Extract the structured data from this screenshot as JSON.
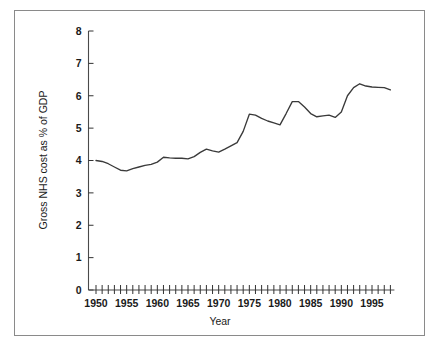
{
  "chart_data": {
    "type": "line",
    "title": "",
    "xlabel": "Year",
    "ylabel": "Gross NHS cost as % of GDP",
    "xlim": [
      1949,
      1998.5
    ],
    "ylim": [
      0,
      8
    ],
    "grid": false,
    "legend": null,
    "y_ticks": [
      "0",
      "1",
      "2",
      "3",
      "4",
      "5",
      "6",
      "7",
      "8"
    ],
    "y_tick_values": [
      0,
      1,
      2,
      3,
      4,
      5,
      6,
      7,
      8
    ],
    "x_ticks": [
      "1950",
      "1955",
      "1960",
      "1965",
      "1970",
      "1975",
      "1980",
      "1985",
      "1990",
      "1995"
    ],
    "x_tick_values": [
      1950,
      1955,
      1960,
      1965,
      1970,
      1975,
      1980,
      1985,
      1990,
      1995
    ],
    "x_minor_tick_interval": 1,
    "line_color": "#3a3a3a",
    "x": [
      1950,
      1951,
      1952,
      1953,
      1954,
      1955,
      1956,
      1957,
      1958,
      1959,
      1960,
      1961,
      1962,
      1963,
      1964,
      1965,
      1966,
      1967,
      1968,
      1969,
      1970,
      1971,
      1972,
      1973,
      1974,
      1975,
      1976,
      1977,
      1978,
      1979,
      1980,
      1981,
      1982,
      1983,
      1984,
      1985,
      1986,
      1987,
      1988,
      1989,
      1990,
      1991,
      1992,
      1993,
      1994,
      1995,
      1996,
      1997,
      1998
    ],
    "values": [
      4.0,
      3.97,
      3.9,
      3.8,
      3.7,
      3.68,
      3.75,
      3.8,
      3.85,
      3.88,
      3.95,
      4.1,
      4.08,
      4.07,
      4.07,
      4.05,
      4.12,
      4.25,
      4.35,
      4.3,
      4.26,
      4.35,
      4.45,
      4.55,
      4.9,
      5.43,
      5.4,
      5.3,
      5.22,
      5.16,
      5.1,
      5.45,
      5.82,
      5.82,
      5.65,
      5.45,
      5.35,
      5.38,
      5.4,
      5.33,
      5.5,
      6.0,
      6.25,
      6.37,
      6.3,
      6.27,
      6.26,
      6.25,
      6.18
    ],
    "series_name": "Gross NHS cost as % of GDP"
  },
  "axis": {
    "x_title": "Year",
    "y_title": "Gross NHS cost as % of GDP"
  }
}
